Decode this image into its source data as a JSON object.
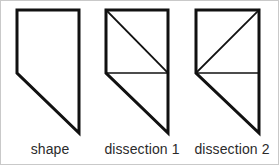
{
  "figure": {
    "background_color": "#ffffff",
    "stroke_color": "#111111",
    "border_color": "#c9c9c9",
    "outline_width": 3,
    "cut_line_width": 1.4,
    "width": 279,
    "height": 165
  },
  "panels": [
    {
      "id": "shape",
      "caption": "shape",
      "outline_points": "16,9 78,9 78,132 16,72",
      "cuts": []
    },
    {
      "id": "dissection-1",
      "caption": "dissection 1",
      "outline_points": "105,9 167,9 167,132 105,72",
      "cuts": [
        {
          "name": "horizontal-cut",
          "x1": 105,
          "y1": 72,
          "x2": 167,
          "y2": 72
        },
        {
          "name": "square-diagonal-cut",
          "x1": 105,
          "y1": 9,
          "x2": 167,
          "y2": 72
        }
      ]
    },
    {
      "id": "dissection-2",
      "caption": "dissection 2",
      "outline_points": "195,9 258,9 258,132 195,72",
      "cuts": [
        {
          "name": "horizontal-cut",
          "x1": 195,
          "y1": 72,
          "x2": 258,
          "y2": 72
        },
        {
          "name": "square-diagonal-cut",
          "x1": 195,
          "y1": 72,
          "x2": 258,
          "y2": 9
        }
      ]
    }
  ],
  "captions": {
    "shape": "shape",
    "dissection_1": "dissection 1",
    "dissection_2": "dissection 2"
  }
}
